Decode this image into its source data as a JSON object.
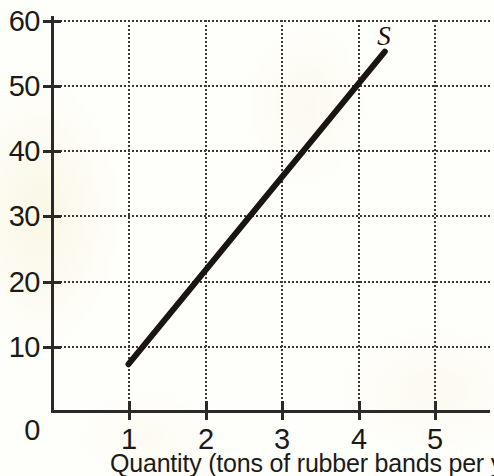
{
  "chart_data": {
    "type": "line",
    "title": "",
    "subtitle": "",
    "xlabel": "Quantity (tons of rubber bands per year)",
    "ylabel": "",
    "xlim": [
      0,
      5.7
    ],
    "ylim": [
      0,
      60
    ],
    "xticks": [
      "1",
      "2",
      "3",
      "4",
      "5"
    ],
    "xtick_values": [
      1,
      2,
      3,
      4,
      5
    ],
    "yticks": [
      "0",
      "10",
      "20",
      "30",
      "40",
      "50",
      "60"
    ],
    "ytick_values": [
      0,
      10,
      20,
      30,
      40,
      50,
      60
    ],
    "grid": "dotted",
    "legend": "none",
    "series": [
      {
        "name": "S",
        "label": "S",
        "label_style": "italic",
        "color": "#1a1512",
        "linewidth": 6,
        "x": [
          1,
          2,
          3,
          4,
          4.35
        ],
        "values": [
          7.2,
          21.6,
          36.0,
          50.4,
          55.3
        ]
      }
    ],
    "annotations": [
      {
        "text": "S",
        "x": 4.5,
        "y": 57.5
      }
    ]
  },
  "axes": {
    "x_axis_title": "Quantity (tons of rubber bands per year)",
    "y_axis_title": ""
  },
  "colors": {
    "background": "#fefefb",
    "ink": "#2b2a28",
    "curve": "#1a1512",
    "grid": "#3a3936"
  }
}
